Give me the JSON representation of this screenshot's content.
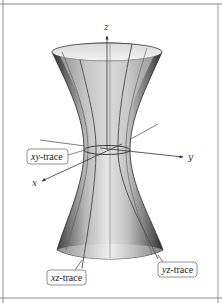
{
  "figure": {
    "axes": {
      "x_label": "x",
      "y_label": "y",
      "z_label": "z"
    },
    "callouts": [
      {
        "id": "xy",
        "var": "xy",
        "suffix": "-trace"
      },
      {
        "id": "xz",
        "var": "xz",
        "suffix": "-trace"
      },
      {
        "id": "yz",
        "var": "yz",
        "suffix": "-trace"
      }
    ],
    "colors": {
      "frame": "#8a8a8a",
      "surface_light": "#f2f2f2",
      "surface_dark": "#4a4a4a",
      "trace_line": "#555555",
      "axis": "#333333",
      "callout_border": "#777777"
    }
  }
}
